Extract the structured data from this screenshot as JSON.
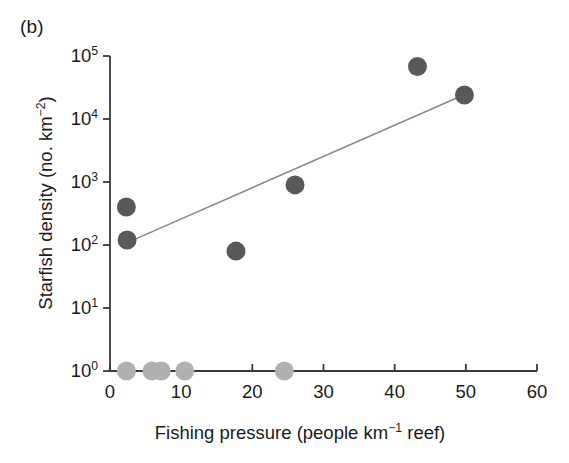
{
  "panel": {
    "label": "(b)"
  },
  "chart_data": {
    "type": "scatter",
    "title": "",
    "panel_label": "(b)",
    "xlabel": "Fishing pressure (people km−1 reef)",
    "xlabel_parts": {
      "text": "Fishing pressure (people km",
      "sup": "−1",
      "tail": " reef)"
    },
    "ylabel": "Starfish density (no. km−2)",
    "ylabel_parts": {
      "text": "Starfish density (no. km",
      "sup": "−2",
      "tail": ")"
    },
    "xscale": "linear",
    "yscale": "log",
    "xlim": [
      0,
      60
    ],
    "ylim": [
      1,
      100000
    ],
    "grid": false,
    "legend": "none",
    "xticks": [
      0,
      10,
      20,
      30,
      40,
      50,
      60
    ],
    "xtick_labels": [
      "0",
      "10",
      "20",
      "30",
      "40",
      "50",
      "60"
    ],
    "yticks": [
      1,
      10,
      100,
      1000,
      10000,
      100000
    ],
    "ytick_labels": [
      "10⁰",
      "10¹",
      "10²",
      "10³",
      "10⁴",
      "10⁵"
    ],
    "ytick_mantissa": "10",
    "ytick_exponents": [
      "0",
      "1",
      "2",
      "3",
      "4",
      "5"
    ],
    "series": [
      {
        "name": "starfish present",
        "marker": "circle",
        "color": "#595959",
        "marker_size": 19,
        "points": [
          {
            "x": 2.3,
            "y": 400
          },
          {
            "x": 2.4,
            "y": 120
          },
          {
            "x": 17.7,
            "y": 80
          },
          {
            "x": 26.0,
            "y": 900
          },
          {
            "x": 43.2,
            "y": 68000
          },
          {
            "x": 49.8,
            "y": 24000
          }
        ]
      },
      {
        "name": "starfish absent",
        "marker": "circle",
        "color": "#b0b0b0",
        "marker_size": 19,
        "points": [
          {
            "x": 2.3,
            "y": 1
          },
          {
            "x": 5.9,
            "y": 1
          },
          {
            "x": 7.2,
            "y": 1
          },
          {
            "x": 10.5,
            "y": 1
          },
          {
            "x": 24.5,
            "y": 1
          }
        ]
      }
    ],
    "trendline": {
      "name": "regression-line",
      "color": "#8a8a8a",
      "width": 1.6,
      "x_start": 2.5,
      "y_start": 110,
      "x_end": 50.0,
      "y_end": 25000
    },
    "axis_color": "#3a3a3a"
  }
}
